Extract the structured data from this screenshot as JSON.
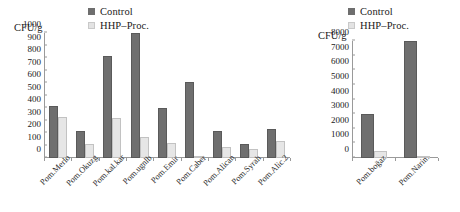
{
  "figure": {
    "background": "#ffffff",
    "series_colors": {
      "control": "#6f6f6f",
      "hhp": "#e6e6e6"
    }
  },
  "legend": {
    "control_label": "Control",
    "hhp_label": "HHP–Proc."
  },
  "left_panel": {
    "y_axis_title": "CFU/g",
    "y_ticks": [
      "0",
      "100",
      "200",
      "300",
      "400",
      "500",
      "600",
      "700",
      "800",
      "900",
      "1000"
    ],
    "categories": [
      "Pom.Merlo",
      "Pom.Okuzg",
      "Pom.kal.kar",
      "Pom.ugnlb",
      "Pom.Emir",
      "Pom.Caber",
      "Pom.Alican",
      "Pom.Syrah",
      "Pom.Alic.2"
    ]
  },
  "right_panel": {
    "y_axis_title": "CFU/g",
    "y_ticks": [
      "0",
      "1000",
      "2000",
      "3000",
      "4000",
      "5000",
      "6000",
      "7000",
      "8000"
    ],
    "categories": [
      "Pom.boğaz",
      "Pom.Narin."
    ]
  },
  "chart_data": [
    {
      "type": "bar",
      "title": "",
      "panel": "left",
      "xlabel": "",
      "ylabel": "CFU/g",
      "ylim": [
        0,
        1000
      ],
      "ytick_step": 100,
      "grid": false,
      "legend_position": "top-center",
      "categories": [
        "Pom.Merlo",
        "Pom.Okuzg",
        "Pom.kal.kar",
        "Pom.ugnlb",
        "Pom.Emir",
        "Pom.Caber",
        "Pom.Alican",
        "Pom.Syrah",
        "Pom.Alic.2"
      ],
      "series": [
        {
          "name": "Control",
          "color": "#6f6f6f",
          "values": [
            420,
            220,
            820,
            1010,
            400,
            610,
            215,
            110,
            230
          ]
        },
        {
          "name": "HHP–Proc.",
          "color": "#e6e6e6",
          "values": [
            330,
            110,
            320,
            170,
            120,
            20,
            90,
            70,
            140
          ]
        }
      ]
    },
    {
      "type": "bar",
      "title": "",
      "panel": "right",
      "xlabel": "",
      "ylabel": "CFU/g",
      "ylim": [
        0,
        8000
      ],
      "ytick_step": 1000,
      "grid": false,
      "legend_position": "top-center",
      "categories": [
        "Pom.boğaz",
        "Pom.Narin."
      ],
      "series": [
        {
          "name": "Control",
          "color": "#6f6f6f",
          "values": [
            3000,
            8300
          ]
        },
        {
          "name": "HHP–Proc.",
          "color": "#e6e6e6",
          "values": [
            500,
            100
          ]
        }
      ]
    }
  ]
}
